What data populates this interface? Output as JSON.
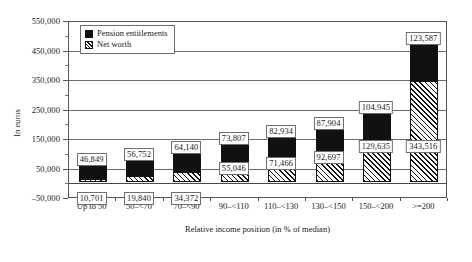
{
  "chart_data": {
    "type": "bar",
    "subtype": "stacked-bar",
    "title": "",
    "xlabel": "Relative income position (in % of median)",
    "ylabel": "In euros",
    "ylim": [
      -50000,
      550000
    ],
    "ytick_step": 100000,
    "grid": true,
    "legend_position": "top-left-inside",
    "categories": [
      "Up to 50",
      "50–<70",
      "70–<90",
      "90–<110",
      "110–<130",
      "130–<150",
      "150–<200",
      ">=200"
    ],
    "ytick_labels": [
      "550,000",
      "450,000",
      "350,000",
      "250,000",
      "150,000",
      "50,000",
      "–50,000"
    ],
    "ytick_values": [
      550000,
      450000,
      350000,
      250000,
      150000,
      50000,
      -50000
    ],
    "series": [
      {
        "name": "Net worth",
        "pattern": "hatched",
        "values": [
          10701,
          19840,
          34372,
          55046,
          71466,
          92697,
          129635,
          343516
        ],
        "labels": [
          "10,701",
          "19,840",
          "34,372",
          "55,046",
          "71,466",
          "92,697",
          "129,635",
          "343,516"
        ]
      },
      {
        "name": "Pension entitlements",
        "pattern": "solid-black",
        "values": [
          46849,
          56752,
          64140,
          73807,
          82934,
          87904,
          104945,
          123587
        ],
        "labels": [
          "46,849",
          "56,752",
          "64,140",
          "73,807",
          "82,934",
          "87,904",
          "104,945",
          "123,587"
        ]
      }
    ]
  },
  "legend": {
    "items": [
      {
        "label": "Pension entitlements",
        "swatch": "solid-black"
      },
      {
        "label": "Net worth",
        "swatch": "hatched"
      }
    ]
  }
}
